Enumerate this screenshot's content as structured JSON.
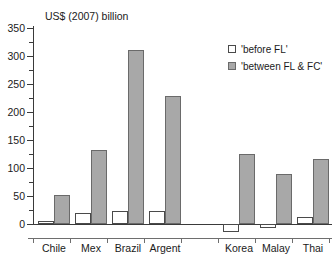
{
  "chart_data": {
    "type": "bar",
    "title": "US$ (2007) billion",
    "xlabel": "",
    "ylabel": "",
    "ylim": [
      -25,
      350
    ],
    "yticks": [
      0,
      50,
      100,
      150,
      200,
      250,
      300,
      350
    ],
    "ytick_labels": [
      "0",
      "50",
      "100",
      "150",
      "200",
      "250",
      "300",
      "350"
    ],
    "grid": false,
    "legend_position": "top-right",
    "categories": [
      "Chile",
      "Mex",
      "Brazil",
      "Argent",
      "",
      "Korea",
      "Malay",
      "Thai"
    ],
    "series": [
      {
        "name": "'before FL'",
        "color": "#ffffff",
        "values": [
          5,
          19,
          23,
          23,
          null,
          -15,
          -7,
          12
        ]
      },
      {
        "name": "'between FL & FC'",
        "color": "#a8a8a8",
        "values": [
          52,
          132,
          310,
          228,
          null,
          125,
          89,
          116
        ]
      }
    ]
  },
  "legend": {
    "items": [
      {
        "label": "'before FL'",
        "swatch": "white"
      },
      {
        "label": "'between FL & FC'",
        "swatch": "gray"
      }
    ]
  }
}
